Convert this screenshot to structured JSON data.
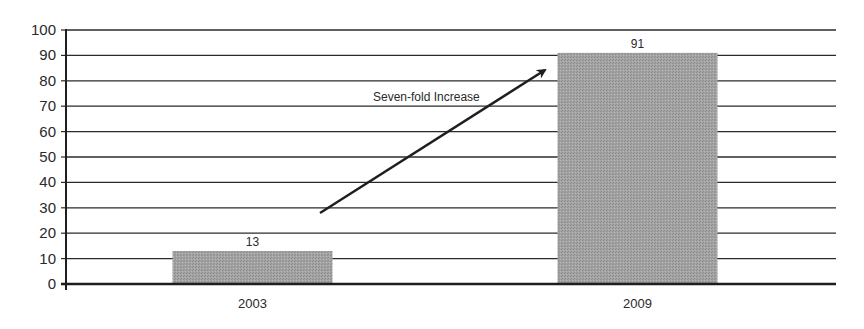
{
  "chart_data": {
    "type": "bar",
    "title": "",
    "xlabel": "",
    "ylabel": "",
    "categories": [
      "2003",
      "2009"
    ],
    "values": [
      13,
      91
    ],
    "data_labels": [
      "13",
      "91"
    ],
    "ylim": [
      0,
      100
    ],
    "yticks": [
      "0",
      "10",
      "20",
      "30",
      "40",
      "50",
      "60",
      "70",
      "80",
      "90",
      "100"
    ],
    "grid": true,
    "legend": null,
    "bar_color": "#a0a0a0",
    "annotations": [
      {
        "type": "arrow",
        "text": "Seven-fold Increase",
        "from_category": "2003",
        "to_category": "2009"
      }
    ]
  }
}
